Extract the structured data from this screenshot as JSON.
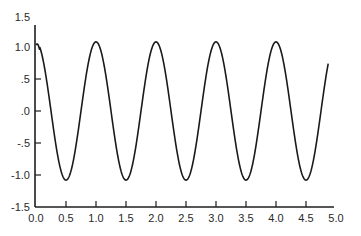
{
  "chart_data": {
    "type": "line",
    "title": "",
    "xlabel": "",
    "ylabel": "",
    "xlim": [
      0.0,
      5.0
    ],
    "ylim": [
      -1.5,
      1.5
    ],
    "grid": false,
    "legend": null,
    "x_ticks": [
      "0.0",
      "0.5",
      "1.0",
      "1.5",
      "2.0",
      "2.5",
      "3.0",
      "3.5",
      "4.0",
      "4.5",
      "5.0"
    ],
    "y_ticks": [
      "1.5",
      "1.0",
      ".5",
      ".0",
      "-.5",
      "-1.0",
      "-1.5"
    ],
    "series": [
      {
        "name": "oscillation",
        "description": "Sustained sinusoidal oscillation, period 1.0, amplitude ~1.08, starting near 1.03 at t=0",
        "x": [
          0.0,
          0.25,
          0.5,
          0.75,
          1.0,
          1.25,
          1.5,
          1.75,
          2.0,
          2.25,
          2.5,
          2.75,
          3.0,
          3.25,
          3.5,
          3.75,
          4.0,
          4.25,
          4.5,
          4.75,
          4.87
        ],
        "y": [
          1.03,
          0.0,
          -1.08,
          0.0,
          1.08,
          0.0,
          -1.08,
          0.0,
          1.08,
          0.0,
          -1.08,
          0.0,
          1.08,
          0.0,
          -1.08,
          0.0,
          1.08,
          0.0,
          -1.08,
          0.0,
          0.74
        ],
        "amplitude": 1.08,
        "period": 1.0,
        "x_end": 4.87
      }
    ]
  }
}
